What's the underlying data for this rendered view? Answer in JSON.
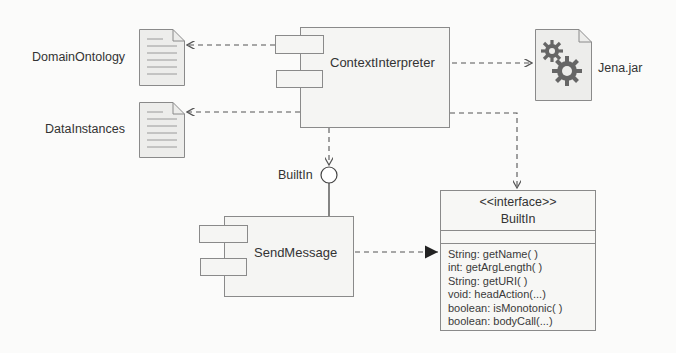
{
  "diagram": {
    "components": {
      "context_interpreter": {
        "name": "ContextInterpreter"
      },
      "send_message": {
        "name": "SendMessage"
      }
    },
    "artifacts": {
      "domain_ontology": {
        "name": "DomainOntology",
        "icon": "document-icon"
      },
      "data_instances": {
        "name": "DataInstances",
        "icon": "document-icon"
      },
      "jena": {
        "name": "Jena.jar",
        "icon": "gears-icon"
      }
    },
    "provided_interface": {
      "name": "BuiltIn"
    },
    "interface_class": {
      "stereotype": "<<interface>>",
      "name": "BuiltIn",
      "operations": [
        "String: getName( )",
        "int: getArgLength( )",
        "String: getURI( )",
        "void: headAction(...)",
        "boolean: isMonotonic( )",
        "boolean: bodyCall(...)"
      ]
    },
    "relations": [
      {
        "from": "ContextInterpreter",
        "to": "DomainOntology",
        "type": "dependency"
      },
      {
        "from": "ContextInterpreter",
        "to": "DataInstances",
        "type": "dependency"
      },
      {
        "from": "ContextInterpreter",
        "to": "Jena.jar",
        "type": "dependency"
      },
      {
        "from": "ContextInterpreter",
        "to": "BuiltIn (lollipop)",
        "type": "required-interface"
      },
      {
        "from": "ContextInterpreter",
        "to": "BuiltIn interface",
        "type": "dependency"
      },
      {
        "from": "SendMessage",
        "to": "BuiltIn (lollipop)",
        "type": "provides"
      },
      {
        "from": "SendMessage",
        "to": "BuiltIn interface",
        "type": "realization"
      }
    ],
    "colors": {
      "line": "#555555",
      "box_fill": "#f5f5f3",
      "border": "#8a8a8a"
    }
  }
}
